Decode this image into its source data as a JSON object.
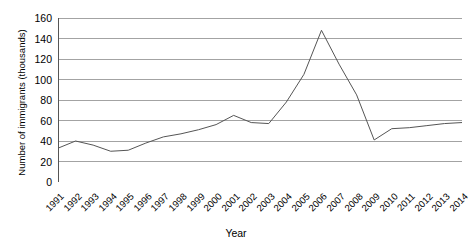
{
  "chart_data": {
    "type": "line",
    "title": "",
    "xlabel": "Year",
    "ylabel": "Number of immigrants (thousands)",
    "categories": [
      "1991",
      "1992",
      "1993",
      "1994",
      "1995",
      "1996",
      "1997",
      "1998",
      "1999",
      "2000",
      "2001",
      "2002",
      "2003",
      "2004",
      "2005",
      "2006",
      "2007",
      "2008",
      "2009",
      "2010",
      "2011",
      "2012",
      "2013",
      "2014"
    ],
    "values": [
      33,
      40,
      36,
      30,
      31,
      38,
      44,
      47,
      51,
      56,
      65,
      58,
      57,
      78,
      105,
      148,
      115,
      85,
      41,
      52,
      53,
      55,
      57,
      58
    ],
    "ylim": [
      0,
      160
    ],
    "yticks": [
      0,
      20,
      40,
      60,
      80,
      100,
      120,
      140,
      160
    ],
    "ytick_labels": [
      "0",
      "20",
      "40",
      "60",
      "80",
      "100",
      "120",
      "140",
      "160"
    ],
    "grid": true,
    "grid_axis": "y",
    "legend": false,
    "series_color": "#555555",
    "grid_color": "#999999",
    "axis_color": "#555555"
  }
}
